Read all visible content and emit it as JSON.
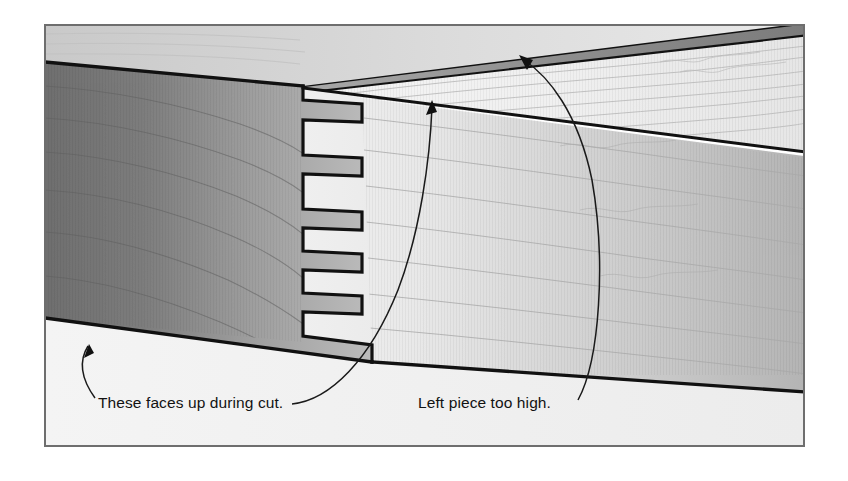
{
  "figure": {
    "type": "technical-illustration",
    "frame": {
      "border_color": "#6e6e6e",
      "background_color": "#ffffff",
      "x": 44,
      "y": 24,
      "width": 761,
      "height": 423
    },
    "palette": {
      "page_background": "#ffffff",
      "frame_border": "#6e6e6e",
      "left_board_end_grain_dark": "#7a7a7a",
      "left_board_end_grain_light": "#b4b4b4",
      "left_board_top_face": "#d2d2d2",
      "right_board_face_light": "#ededed",
      "right_board_face_dark": "#b6b6b6",
      "right_board_top_face": "#f3f3f3",
      "upper_board_edge_dark": "#8a8a8a",
      "lower_background": "#f2f2f2",
      "outline": "#111111",
      "grain_line": "#9a9a9a",
      "leader_line": "#1a1a1a",
      "text": "#121212"
    },
    "parts": [
      {
        "name": "left-board",
        "description": "Dark end-grain board entering from the left with cut fingers on its right end",
        "face_shading": "dark gray gradient, darker at left"
      },
      {
        "name": "right-board",
        "description": "Light face board extending to the right, interlocking with the left board fingers",
        "face_shading": "light gradient, lighter at the joint, darker to the right"
      },
      {
        "name": "upper-board",
        "description": "Thin board along the top with a dark edge band",
        "face_shading": "very light top face with wavy grain"
      },
      {
        "name": "finger-joint",
        "description": "Interlocking square fingers (box joint) at the seam",
        "finger_count": 6
      },
      {
        "name": "misalignment-step",
        "description": "Small step at the bottom of the joint where the left piece sits proud"
      }
    ],
    "callouts": [
      {
        "id": "faces-up",
        "label": "These faces up during cut.",
        "text_x": 98,
        "text_y": 408,
        "points_to": "top surfaces of the boards that face upward while cutting"
      },
      {
        "id": "too-high",
        "label": "Left piece too high.",
        "text_x": 418,
        "text_y": 408,
        "points_to": "proud upper edge of the left board at the joint"
      }
    ]
  }
}
